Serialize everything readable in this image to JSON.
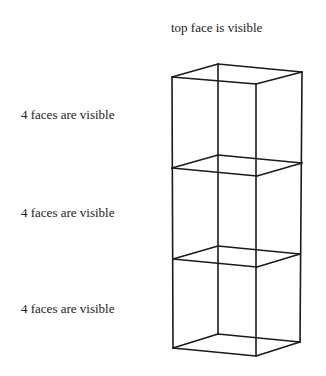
{
  "labels": {
    "top": "top face is visible",
    "upper": "4 faces are visible",
    "middle": "4 faces are visible",
    "lower": "4 faces are visible"
  },
  "colors": {
    "stroke": "#1a1a1a",
    "text": "#222222",
    "background": "#ffffff"
  },
  "diagram": {
    "type": "stacked-wireframe-cubes",
    "cube_count": 3,
    "planes": [
      {
        "name": "top",
        "left": [
          172,
          77
        ],
        "back": [
          218,
          64
        ],
        "right": [
          302,
          72
        ],
        "front": [
          256,
          84
        ]
      },
      {
        "name": "divider-1",
        "left": [
          172,
          168
        ],
        "back": [
          218,
          155
        ],
        "right": [
          302,
          163
        ],
        "front": [
          257,
          176
        ]
      },
      {
        "name": "divider-2",
        "left": [
          173,
          259
        ],
        "back": [
          218,
          246
        ],
        "right": [
          300,
          254
        ],
        "front": [
          257,
          267
        ]
      },
      {
        "name": "bottom",
        "left": [
          173,
          348
        ],
        "back": [
          218,
          334
        ],
        "right": [
          300,
          342
        ],
        "front": [
          256,
          356
        ]
      }
    ]
  }
}
